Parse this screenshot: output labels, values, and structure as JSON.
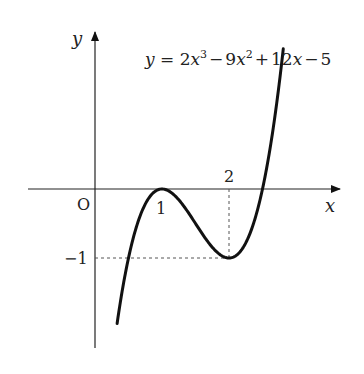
{
  "chart_data": {
    "type": "line",
    "equation_label": {
      "lhs": "y",
      "eq": "=",
      "t1": "2",
      "v1": "x",
      "e1": "3",
      "op1": "−",
      "t2": "9",
      "v2": "x",
      "e2": "2",
      "op2": "+",
      "t3": "12",
      "v3": "x",
      "op3": "−",
      "t4": "5"
    },
    "xlabel": "x",
    "ylabel": "y",
    "origin_label": "O",
    "x_ticks": [
      {
        "value": 1,
        "label": "1"
      },
      {
        "value": 2,
        "label": "2"
      }
    ],
    "y_ticks": [
      {
        "value": -1,
        "label": "−1"
      }
    ],
    "function": "2x^3-9x^2+12x-5",
    "x_range": [
      0.33,
      2.81
    ],
    "key_points": [
      {
        "x": 1,
        "y": 0,
        "note": "local maximum (tangent to x-axis)"
      },
      {
        "x": 2,
        "y": -1,
        "note": "local minimum"
      }
    ],
    "guides": [
      {
        "from": [
          2,
          0
        ],
        "to": [
          2,
          -1
        ],
        "style": "dashed"
      },
      {
        "from": [
          0,
          -1
        ],
        "to": [
          2,
          -1
        ],
        "style": "dashed"
      }
    ],
    "grid": false
  }
}
